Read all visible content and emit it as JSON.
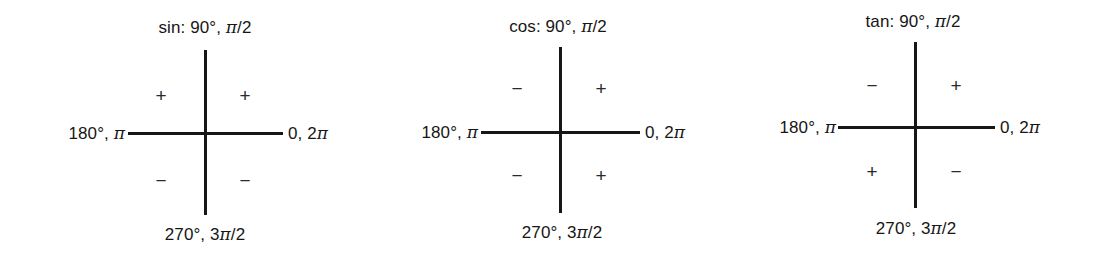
{
  "background_color": "#ffffff",
  "line_color": "#161616",
  "text_color": "#161616",
  "figure": {
    "diagrams": [
      {
        "id": "sin",
        "function_label": "sin:",
        "top_label": "sin: 90°, π/2",
        "top_angle_deg": "90°",
        "top_angle_rad": "π/2",
        "right_label": "0, 2π",
        "bottom_label": "270°, 3π/2",
        "left_label": "180°, π",
        "quadrant_signs": {
          "q1_upper_right": "+",
          "q2_upper_left": "+",
          "q3_lower_left": "−",
          "q4_lower_right": "−"
        },
        "center_x": 205,
        "center_y": 133,
        "h_axis_left": 128,
        "h_axis_right": 283,
        "v_axis_top": 50,
        "v_axis_bottom": 215
      },
      {
        "id": "cos",
        "function_label": "cos:",
        "top_label": "cos: 90°, π/2",
        "top_angle_deg": "90°",
        "top_angle_rad": "π/2",
        "right_label": "0, 2π",
        "bottom_label": "270°, 3π/2",
        "left_label": "180°, π",
        "quadrant_signs": {
          "q1_upper_right": "+",
          "q2_upper_left": "−",
          "q3_lower_left": "−",
          "q4_lower_right": "+"
        },
        "center_x": 560,
        "center_y": 132,
        "h_axis_left": 481,
        "h_axis_right": 640,
        "v_axis_top": 47,
        "v_axis_bottom": 213
      },
      {
        "id": "tan",
        "function_label": "tan:",
        "top_label": "tan: 90°, π/2",
        "top_angle_deg": "90°",
        "top_angle_rad": "π/2",
        "right_label": "0, 2π",
        "bottom_label": "270°, 3π/2",
        "left_label": "180°, π",
        "quadrant_signs": {
          "q1_upper_right": "+",
          "q2_upper_left": "−",
          "q3_lower_left": "+",
          "q4_lower_right": "−"
        },
        "center_x": 915,
        "center_y": 127,
        "h_axis_left": 838,
        "h_axis_right": 995,
        "v_axis_top": 42,
        "v_axis_bottom": 208
      }
    ]
  }
}
